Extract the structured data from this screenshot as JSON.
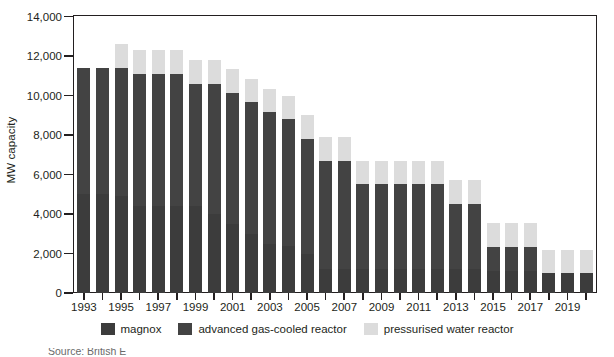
{
  "chart_data": {
    "type": "bar",
    "subtype": "stacked-vertical",
    "title": "",
    "subtitle": "",
    "xlabel": "",
    "ylabel": "MW capacity",
    "ylim": [
      0,
      14000
    ],
    "ytick_values": [
      14000,
      12000,
      10000,
      8000,
      6000,
      4000,
      2000,
      0
    ],
    "ytick_labels": [
      "14,000",
      "12,000",
      "10,000",
      "8,000",
      "6,000",
      "4,000",
      "2,000",
      "0"
    ],
    "grid": false,
    "legend_position": "bottom-center",
    "x": [
      1993,
      1994,
      1995,
      1996,
      1997,
      1998,
      1999,
      2000,
      2001,
      2002,
      2003,
      2004,
      2005,
      2006,
      2007,
      2008,
      2009,
      2010,
      2011,
      2012,
      2013,
      2014,
      2015,
      2016,
      2017,
      2018,
      2019,
      2020
    ],
    "categories": [
      "1993",
      "1994",
      "1995",
      "1996",
      "1997",
      "1998",
      "1999",
      "2000",
      "2001",
      "2002",
      "2003",
      "2004",
      "2005",
      "2006",
      "2007",
      "2008",
      "2009",
      "2010",
      "2011",
      "2012",
      "2013",
      "2014",
      "2015",
      "2016",
      "2017",
      "2018",
      "2019",
      "2020"
    ],
    "xtick_labels_shown": [
      "1993",
      "1995",
      "1997",
      "1999",
      "2001",
      "2003",
      "2005",
      "2007",
      "2009",
      "2011",
      "2013",
      "2015",
      "2017",
      "2019"
    ],
    "series": [
      {
        "name": "magnox",
        "color": "#3c3c3c",
        "values": [
          5000,
          5000,
          4900,
          4400,
          4400,
          4400,
          4400,
          4000,
          3500,
          3000,
          2500,
          2400,
          2000,
          1200,
          1200,
          1200,
          1200,
          1200,
          1200,
          1200,
          1200,
          1200,
          1100,
          1100,
          1100,
          1000,
          1000,
          1000
        ]
      },
      {
        "name": "advanced gas-cooled reactor",
        "color": "#434343",
        "values": [
          6400,
          6400,
          6500,
          6700,
          6700,
          6700,
          6200,
          6600,
          6650,
          6650,
          6650,
          6400,
          5800,
          5500,
          5500,
          4300,
          4300,
          4300,
          4300,
          4300,
          3300,
          3300,
          1250,
          1250,
          1250,
          0,
          0,
          0
        ]
      },
      {
        "name": "pressurised water reactor",
        "color": "#dcdcdc",
        "values": [
          0,
          0,
          1200,
          1200,
          1200,
          1200,
          1200,
          1200,
          1200,
          1200,
          1200,
          1200,
          1200,
          1200,
          1200,
          1200,
          1200,
          1200,
          1200,
          1200,
          1200,
          1200,
          1200,
          1200,
          1200,
          1200,
          1200,
          1200
        ]
      }
    ],
    "totals": [
      11400,
      11400,
      12600,
      12300,
      12300,
      12300,
      11800,
      11800,
      11350,
      10850,
      10350,
      10000,
      9000,
      7900,
      7900,
      6700,
      6700,
      6700,
      6700,
      6700,
      5700,
      5700,
      3550,
      3550,
      3550,
      2200,
      2200,
      2200
    ],
    "annotations": []
  },
  "legend": {
    "items": [
      {
        "label": "magnox",
        "color": "#3c3c3c",
        "swatch": "legend-swatch-magnox"
      },
      {
        "label": "advanced gas-cooled reactor",
        "color": "#434343",
        "swatch": "legend-swatch-agr"
      },
      {
        "label": "pressurised water reactor",
        "color": "#dcdcdc",
        "swatch": "legend-swatch-pwr"
      }
    ]
  },
  "axes": {
    "y_title": "MW capacity"
  },
  "source_note": "Source: British E",
  "colors": {
    "axis": "#231f20",
    "text": "#231f20",
    "background": "#ffffff",
    "magnox": "#3c3c3c",
    "agr": "#434343",
    "pwr": "#dcdcdc"
  }
}
